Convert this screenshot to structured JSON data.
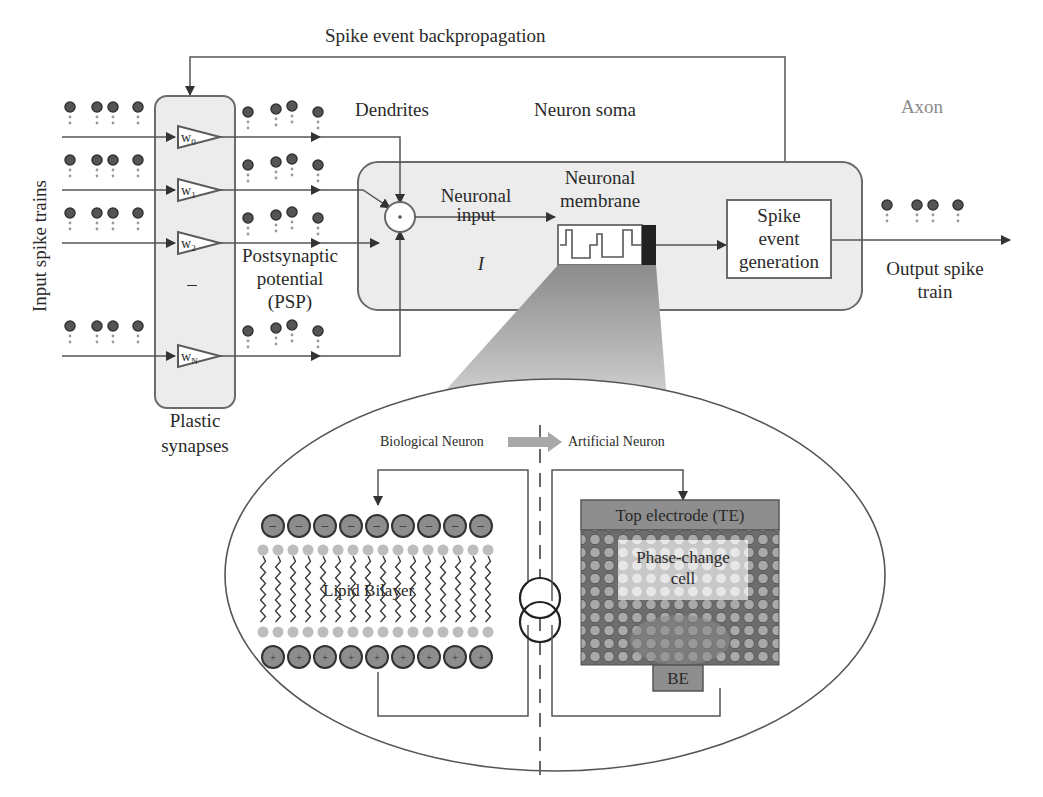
{
  "diagram": {
    "title_backprop": "Spike event backpropagation",
    "input_label": "Input spike trains",
    "synapses": {
      "label_line1": "Plastic",
      "label_line2": "synapses",
      "weights": [
        {
          "base": "w",
          "sub": "0"
        },
        {
          "base": "w",
          "sub": "1"
        },
        {
          "base": "w",
          "sub": "2"
        },
        {
          "base": "w",
          "sub": "N"
        }
      ],
      "ellipsis": "–"
    },
    "dendrites_label": "Dendrites",
    "psp_label_line1": "Postsynaptic",
    "psp_label_line2": "potential",
    "psp_label_line3": "(PSP)",
    "soma_label": "Neuron soma",
    "neuronal_input_line1": "Neuronal",
    "neuronal_input_line2": "input",
    "neuronal_input_symbol": "I",
    "membrane_label_line1": "Neuronal",
    "membrane_label_line2": "membrane",
    "spike_gen_line1": "Spike",
    "spike_gen_line2": "event",
    "spike_gen_line3": "generation",
    "axon_label": "Axon",
    "output_label_line1": "Output spike",
    "output_label_line2": "train",
    "inset": {
      "bio_label": "Biological Neuron",
      "art_label": "Artificial Neuron",
      "lipid_label": "Lipid Bilayer",
      "top_electrode": "Top electrode (TE)",
      "pcm_line1": "Phase-change",
      "pcm_line2": "cell",
      "bottom_electrode": "BE",
      "negative_charge": "−",
      "positive_charge": "+"
    }
  }
}
